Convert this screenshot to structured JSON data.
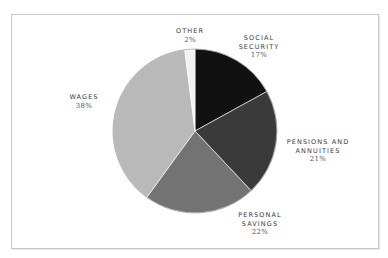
{
  "chart_data": {
    "type": "pie",
    "title": "",
    "start_angle_deg": 0,
    "direction": "clockwise",
    "slices": [
      {
        "label": "Social Security",
        "label_lines": [
          "SOCIAL",
          "SECURITY"
        ],
        "value": 17,
        "pct_text": "17%",
        "color": "#111111"
      },
      {
        "label": "Pensions and Annuities",
        "label_lines": [
          "PENSIONS AND",
          "ANNUITIES"
        ],
        "value": 21,
        "pct_text": "21%",
        "color": "#3a3a3a"
      },
      {
        "label": "Personal Savings",
        "label_lines": [
          "PERSONAL",
          "SAVINGS"
        ],
        "value": 22,
        "pct_text": "22%",
        "color": "#737373"
      },
      {
        "label": "Wages",
        "label_lines": [
          "WAGES"
        ],
        "value": 38,
        "pct_text": "38%",
        "color": "#b9b9b9"
      },
      {
        "label": "Other",
        "label_lines": [
          "OTHER"
        ],
        "value": 2,
        "pct_text": "2%",
        "color": "#f2f2f2"
      }
    ],
    "legend": "none (direct labels)",
    "grid": false
  },
  "labels": {
    "social_security": {
      "l1": "SOCIAL",
      "l2": "SECURITY",
      "pct": "17%"
    },
    "pensions": {
      "l1": "PENSIONS AND",
      "l2": "ANNUITIES",
      "pct": "21%"
    },
    "savings": {
      "l1": "PERSONAL",
      "l2": "SAVINGS",
      "pct": "22%"
    },
    "wages": {
      "l1": "WAGES",
      "pct": "38%"
    },
    "other": {
      "l1": "OTHER",
      "pct": "2%"
    }
  }
}
